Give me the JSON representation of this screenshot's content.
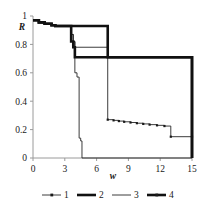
{
  "chart_data": {
    "type": "line",
    "title": "",
    "subtitle": "",
    "xlabel": "w",
    "ylabel": "R",
    "xlim": [
      0,
      15
    ],
    "ylim": [
      0,
      1
    ],
    "xticks": [
      "0",
      "3",
      "6",
      "9",
      "12",
      "15"
    ],
    "xtick_values": [
      0,
      3,
      6,
      9,
      12,
      15
    ],
    "yticks": [
      "0",
      "0.2",
      "0.4",
      "0.6",
      "0.8",
      "1"
    ],
    "ytick_values": [
      0,
      0.2,
      0.4,
      0.6,
      0.8,
      1
    ],
    "grid": false,
    "legend_position": "bottom",
    "step_style": "post",
    "series": [
      {
        "name": "1",
        "label": "1",
        "style": "thin-with-markers",
        "color": "#262626",
        "x": [
          0,
          0.55,
          1.1,
          1.75,
          2.1,
          3.4,
          3.6,
          3.8,
          3.95,
          7.05,
          7.6,
          8.1,
          8.6,
          9.2,
          9.8,
          10.4,
          11.0,
          11.7,
          12.4,
          13.0,
          15
        ],
        "y": [
          0.97,
          0.955,
          0.945,
          0.935,
          0.93,
          0.93,
          0.87,
          0.82,
          0.78,
          0.27,
          0.265,
          0.26,
          0.255,
          0.25,
          0.245,
          0.24,
          0.235,
          0.23,
          0.225,
          0.15,
          0.15
        ]
      },
      {
        "name": "2",
        "label": "2",
        "style": "thick",
        "color": "#111111",
        "x": [
          0,
          0.55,
          1.1,
          1.75,
          2.1,
          6.3,
          7.05,
          15
        ],
        "y": [
          0.97,
          0.955,
          0.945,
          0.935,
          0.93,
          0.93,
          0.71,
          0.0
        ]
      },
      {
        "name": "3",
        "label": "3",
        "style": "thin",
        "color": "#262626",
        "x": [
          0,
          0.55,
          1.1,
          1.75,
          2.1,
          3.4,
          3.6,
          3.8,
          3.95,
          4.15,
          4.35,
          4.5,
          4.62,
          15
        ],
        "y": [
          0.97,
          0.955,
          0.945,
          0.935,
          0.93,
          0.93,
          0.87,
          0.82,
          0.6,
          0.57,
          0.14,
          0.12,
          0.0,
          0.0
        ]
      },
      {
        "name": "4",
        "label": "4",
        "style": "thick-with-markers",
        "color": "#111111",
        "x": [
          0,
          0.55,
          1.1,
          1.75,
          2.1,
          3.4,
          3.6,
          3.8,
          3.95,
          15
        ],
        "y": [
          0.97,
          0.955,
          0.945,
          0.935,
          0.93,
          0.93,
          0.82,
          0.78,
          0.71,
          0.0
        ]
      }
    ],
    "legend_entries": [
      {
        "label": "1",
        "style": "thin-with-markers"
      },
      {
        "label": "2",
        "style": "thick"
      },
      {
        "label": "3",
        "style": "thin"
      },
      {
        "label": "4",
        "style": "thick-with-markers"
      }
    ],
    "colors": {
      "axis": "#9a9a9a",
      "line_thin": "#262626",
      "line_thick": "#111111",
      "background": "#ffffff"
    }
  }
}
